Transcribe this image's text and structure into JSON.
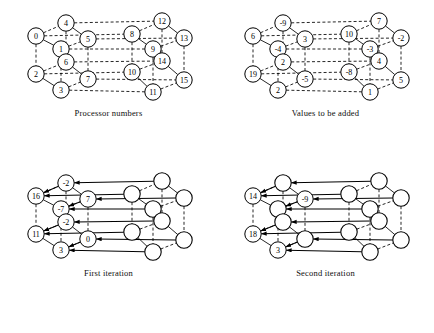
{
  "figure": {
    "panel_count": 4
  },
  "panels": [
    {
      "id": "processor-numbers",
      "caption": "Processor numbers",
      "labels": [
        "0",
        "1",
        "2",
        "3",
        "4",
        "5",
        "6",
        "7",
        "8",
        "9",
        "10",
        "11",
        "12",
        "13",
        "14",
        "15"
      ],
      "show_arrows": false
    },
    {
      "id": "values-to-be-added",
      "caption": "Values to be added",
      "labels": [
        "6",
        "-4",
        "19",
        "2",
        "-9",
        "3",
        "2",
        "-5",
        "10",
        "-3",
        "-8",
        "1",
        "7",
        "-2",
        "4",
        "5"
      ],
      "show_arrows": false
    },
    {
      "id": "first-iteration",
      "caption": "First iteration",
      "labels": [
        "16",
        "-7",
        "11",
        "3",
        "-2",
        "7",
        "-2",
        "0",
        "",
        "",
        "",
        "",
        "",
        "",
        "",
        ""
      ],
      "show_arrows": true
    },
    {
      "id": "second-iteration",
      "caption": "Second iteration",
      "labels": [
        "14",
        "",
        "18",
        "3",
        "",
        "-9",
        "",
        "",
        "",
        "",
        "",
        "",
        "",
        "",
        "",
        ""
      ],
      "show_arrows": true
    }
  ],
  "geometry": {
    "note": "16-node 4-D hypercube drawn as two nested cubes per panel",
    "nodes": [
      {
        "i": 0,
        "x": 14,
        "y": 30
      },
      {
        "i": 1,
        "x": 39,
        "y": 43
      },
      {
        "i": 2,
        "x": 14,
        "y": 68
      },
      {
        "i": 3,
        "x": 39,
        "y": 84
      },
      {
        "i": 4,
        "x": 44,
        "y": 17
      },
      {
        "i": 5,
        "x": 66,
        "y": 33
      },
      {
        "i": 6,
        "x": 44,
        "y": 56
      },
      {
        "i": 7,
        "x": 66,
        "y": 73
      },
      {
        "i": 8,
        "x": 110,
        "y": 28
      },
      {
        "i": 9,
        "x": 131,
        "y": 43
      },
      {
        "i": 10,
        "x": 110,
        "y": 66
      },
      {
        "i": 11,
        "x": 131,
        "y": 86
      },
      {
        "i": 12,
        "x": 140,
        "y": 15
      },
      {
        "i": 13,
        "x": 162,
        "y": 32
      },
      {
        "i": 14,
        "x": 140,
        "y": 55
      },
      {
        "i": 15,
        "x": 162,
        "y": 74
      }
    ]
  },
  "colors": {
    "ink": "#000000",
    "paper": "#ffffff"
  }
}
